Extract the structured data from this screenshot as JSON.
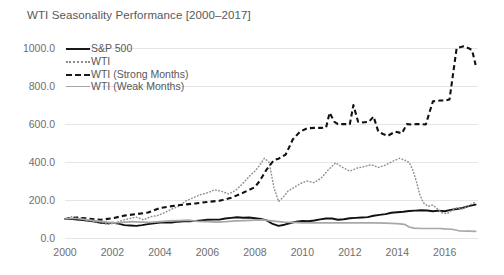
{
  "chart_data": {
    "type": "line",
    "title": "WTI Seasonality Performance [2000–2017]",
    "xlabel": "",
    "ylabel": "",
    "xlim": [
      2000,
      2017.4
    ],
    "ylim": [
      0,
      1080
    ],
    "grid": true,
    "legend_position": "top-left",
    "yticks": [
      "0.0",
      "200.0",
      "400.0",
      "600.0",
      "800.0",
      "1000.0"
    ],
    "ytick_values": [
      0,
      200,
      400,
      600,
      800,
      1000
    ],
    "xticks": [
      "2000",
      "2002",
      "2004",
      "2006",
      "2008",
      "2010",
      "2012",
      "2014",
      "2016"
    ],
    "xtick_values": [
      2000,
      2002,
      2004,
      2006,
      2008,
      2010,
      2012,
      2014,
      2016
    ],
    "colors": {
      "sp500": "#111111",
      "wti": "#8f8f8f",
      "strong_months": "#121212",
      "weak_months": "#a8a8a8",
      "gridline": "#e6e6e6",
      "text": "#585858",
      "background": "#ffffff"
    },
    "series": [
      {
        "name": "S&P 500",
        "style": "solid",
        "color": "#111111",
        "x": [
          2000.0,
          2000.25,
          2000.5,
          2000.75,
          2001.0,
          2001.25,
          2001.5,
          2001.75,
          2002.0,
          2002.25,
          2002.5,
          2002.75,
          2003.0,
          2003.25,
          2003.5,
          2003.75,
          2004.0,
          2004.25,
          2004.5,
          2004.75,
          2005.0,
          2005.25,
          2005.5,
          2005.75,
          2006.0,
          2006.25,
          2006.5,
          2006.75,
          2007.0,
          2007.25,
          2007.5,
          2007.75,
          2008.0,
          2008.25,
          2008.5,
          2008.75,
          2009.0,
          2009.25,
          2009.5,
          2009.75,
          2010.0,
          2010.25,
          2010.5,
          2010.75,
          2011.0,
          2011.25,
          2011.5,
          2011.75,
          2012.0,
          2012.25,
          2012.5,
          2012.75,
          2013.0,
          2013.25,
          2013.5,
          2013.75,
          2014.0,
          2014.25,
          2014.5,
          2014.75,
          2015.0,
          2015.25,
          2015.5,
          2015.75,
          2016.0,
          2016.25,
          2016.5,
          2016.75,
          2017.0,
          2017.3
        ],
        "values": [
          100,
          101,
          97,
          95,
          90,
          86,
          80,
          78,
          80,
          76,
          68,
          66,
          64,
          68,
          73,
          78,
          82,
          82,
          82,
          86,
          88,
          88,
          90,
          93,
          96,
          97,
          97,
          103,
          106,
          109,
          107,
          108,
          104,
          100,
          93,
          74,
          64,
          70,
          79,
          86,
          90,
          88,
          92,
          98,
          103,
          103,
          96,
          99,
          104,
          106,
          108,
          110,
          117,
          122,
          126,
          133,
          136,
          138,
          142,
          144,
          146,
          145,
          141,
          144,
          141,
          148,
          153,
          158,
          168,
          176
        ]
      },
      {
        "name": "WTI",
        "style": "dotted",
        "color": "#8f8f8f",
        "x": [
          2000.0,
          2000.3,
          2000.6,
          2000.9,
          2001.2,
          2001.5,
          2001.8,
          2002.1,
          2002.4,
          2002.7,
          2003.0,
          2003.3,
          2003.6,
          2003.9,
          2004.2,
          2004.5,
          2004.8,
          2005.1,
          2005.4,
          2005.7,
          2006.0,
          2006.3,
          2006.6,
          2006.9,
          2007.2,
          2007.5,
          2007.8,
          2008.0,
          2008.2,
          2008.4,
          2008.6,
          2008.8,
          2009.0,
          2009.2,
          2009.4,
          2009.6,
          2009.9,
          2010.2,
          2010.5,
          2010.8,
          2011.1,
          2011.4,
          2011.7,
          2012.0,
          2012.3,
          2012.6,
          2012.9,
          2013.2,
          2013.5,
          2013.8,
          2014.1,
          2014.35,
          2014.5,
          2014.65,
          2014.8,
          2014.95,
          2015.1,
          2015.3,
          2015.5,
          2015.7,
          2015.9,
          2016.1,
          2016.3,
          2016.5,
          2016.7,
          2016.9,
          2017.1,
          2017.3
        ],
        "values": [
          100,
          112,
          106,
          94,
          88,
          84,
          72,
          78,
          92,
          102,
          110,
          96,
          112,
          118,
          134,
          152,
          168,
          196,
          212,
          228,
          238,
          254,
          246,
          232,
          252,
          288,
          330,
          352,
          384,
          420,
          398,
          268,
          192,
          216,
          248,
          262,
          286,
          300,
          292,
          316,
          360,
          396,
          372,
          352,
          368,
          376,
          386,
          372,
          384,
          404,
          420,
          408,
          398,
          360,
          300,
          228,
          186,
          166,
          174,
          152,
          132,
          128,
          146,
          158,
          152,
          164,
          176,
          190
        ]
      },
      {
        "name": "WTI (Strong Months)",
        "style": "dashed",
        "color": "#121212",
        "x": [
          2000.0,
          2000.5,
          2001.0,
          2001.5,
          2002.0,
          2002.5,
          2003.0,
          2003.5,
          2004.0,
          2004.5,
          2005.0,
          2005.5,
          2006.0,
          2006.5,
          2007.0,
          2007.5,
          2008.0,
          2008.2,
          2008.5,
          2008.8,
          2009.0,
          2009.3,
          2009.6,
          2009.9,
          2010.2,
          2010.5,
          2010.8,
          2011.0,
          2011.15,
          2011.35,
          2011.5,
          2011.8,
          2012.0,
          2012.15,
          2012.35,
          2012.5,
          2012.8,
          2013.0,
          2013.2,
          2013.4,
          2013.6,
          2013.9,
          2014.2,
          2014.4,
          2014.6,
          2014.8,
          2015.0,
          2015.2,
          2015.5,
          2015.8,
          2016.0,
          2016.2,
          2016.5,
          2016.8,
          2017.0,
          2017.15,
          2017.3
        ],
        "values": [
          100,
          108,
          102,
          96,
          104,
          118,
          126,
          134,
          158,
          168,
          176,
          182,
          190,
          196,
          212,
          238,
          268,
          300,
          362,
          410,
          418,
          440,
          520,
          560,
          578,
          580,
          580,
          582,
          660,
          612,
          600,
          600,
          600,
          700,
          612,
          608,
          612,
          640,
          560,
          548,
          538,
          560,
          552,
          600,
          598,
          600,
          600,
          598,
          720,
          724,
          724,
          730,
          1000,
          1010,
          1000,
          990,
          912
        ]
      },
      {
        "name": "WTI (Weak Months)",
        "style": "solid-gray",
        "color": "#a8a8a8",
        "x": [
          2000.0,
          2000.4,
          2000.8,
          2001.2,
          2001.6,
          2002.0,
          2002.4,
          2002.8,
          2003.2,
          2003.6,
          2004.0,
          2004.4,
          2004.8,
          2005.2,
          2005.6,
          2006.0,
          2006.4,
          2006.8,
          2007.2,
          2007.6,
          2008.0,
          2008.3,
          2008.6,
          2008.9,
          2009.2,
          2009.6,
          2010.0,
          2010.5,
          2011.0,
          2011.5,
          2012.0,
          2012.5,
          2013.0,
          2013.5,
          2014.0,
          2014.3,
          2014.5,
          2014.7,
          2015.0,
          2015.4,
          2015.8,
          2016.0,
          2016.3,
          2016.6,
          2017.0,
          2017.3
        ],
        "values": [
          100,
          104,
          98,
          92,
          86,
          80,
          82,
          86,
          84,
          82,
          86,
          90,
          92,
          94,
          88,
          86,
          84,
          86,
          90,
          92,
          94,
          96,
          92,
          88,
          84,
          82,
          80,
          80,
          80,
          80,
          80,
          80,
          80,
          78,
          76,
          72,
          58,
          52,
          50,
          50,
          50,
          48,
          46,
          38,
          36,
          35
        ]
      }
    ],
    "legend": [
      {
        "label": "S&P 500",
        "style": "solid",
        "color": "#111111"
      },
      {
        "label": "WTI",
        "style": "dotted",
        "color": "#8f8f8f"
      },
      {
        "label": "WTI (Strong Months)",
        "style": "dashed",
        "color": "#121212"
      },
      {
        "label": "WTI (Weak Months)",
        "style": "solid-gray",
        "color": "#a8a8a8"
      }
    ]
  }
}
